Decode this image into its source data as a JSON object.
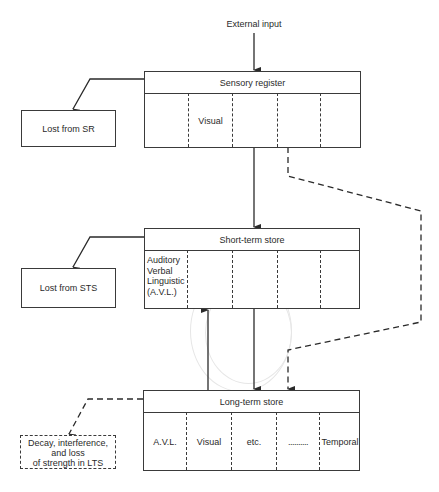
{
  "external_input": "External input",
  "sensory_register": {
    "title": "Sensory register",
    "cells": [
      "",
      "Visual",
      "",
      "",
      ""
    ],
    "loss_label": "Lost from SR"
  },
  "short_term_store": {
    "title": "Short-term store",
    "cells": [
      "Auditory\nVerbal\nLinguistic\n(A.V.L.)",
      "",
      "",
      "",
      ""
    ],
    "cell_lines": [
      "Auditory",
      "Verbal",
      "Linguistic",
      "(A.V.L.)"
    ],
    "loss_label": "Lost from STS"
  },
  "long_term_store": {
    "title": "Long-term store",
    "cells": [
      "A.V.L.",
      "Visual",
      "etc.",
      "..........",
      "Temporal"
    ],
    "loss_lines": [
      "Decay, interference,",
      "and loss",
      "of strength in LTS"
    ]
  },
  "colors": {
    "line": "#3a3a3a",
    "text": "#2a2a2a",
    "background": "#ffffff"
  }
}
